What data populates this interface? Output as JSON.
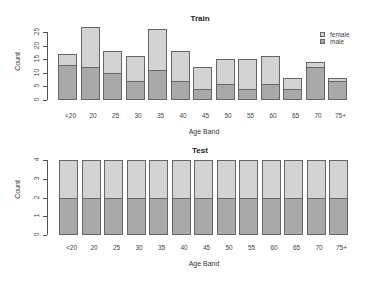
{
  "colors": {
    "female": "#d3d3d3",
    "male": "#a9a9a9",
    "border": "#666666"
  },
  "chart_data": [
    {
      "type": "bar",
      "stacked": true,
      "title": "Train",
      "xlabel": "Age Band",
      "ylabel": "Count",
      "ylim": [
        0,
        27
      ],
      "yticks": [
        0,
        5,
        10,
        15,
        20,
        25
      ],
      "categories": [
        "<20",
        "20",
        "25",
        "30",
        "35",
        "40",
        "45",
        "50",
        "55",
        "60",
        "65",
        "70",
        "75+"
      ],
      "series": [
        {
          "name": "male",
          "values": [
            13,
            12,
            10,
            7,
            11,
            7,
            4,
            6,
            4,
            6,
            4,
            12,
            7
          ]
        },
        {
          "name": "female",
          "values": [
            4,
            15,
            8,
            9,
            15,
            11,
            8,
            9,
            11,
            10,
            4,
            2,
            1
          ]
        }
      ],
      "totals": [
        17,
        27,
        18,
        16,
        26,
        18,
        12,
        15,
        15,
        16,
        8,
        14,
        8
      ],
      "legend": {
        "position": "top-right",
        "entries": [
          "female",
          "male"
        ]
      },
      "grid": false
    },
    {
      "type": "bar",
      "stacked": true,
      "title": "Test",
      "xlabel": "Age Band",
      "ylabel": "Count",
      "ylim": [
        0,
        4
      ],
      "yticks": [
        0,
        1,
        2,
        3,
        4
      ],
      "categories": [
        "<20",
        "20",
        "25",
        "30",
        "35",
        "40",
        "45",
        "50",
        "55",
        "60",
        "65",
        "70",
        "75+"
      ],
      "series": [
        {
          "name": "male",
          "values": [
            2,
            2,
            2,
            2,
            2,
            2,
            2,
            2,
            2,
            2,
            2,
            2,
            2
          ]
        },
        {
          "name": "female",
          "values": [
            2,
            2,
            2,
            2,
            2,
            2,
            2,
            2,
            2,
            2,
            2,
            2,
            2
          ]
        }
      ],
      "totals": [
        4,
        4,
        4,
        4,
        4,
        4,
        4,
        4,
        4,
        4,
        4,
        4,
        4
      ],
      "grid": false
    }
  ]
}
